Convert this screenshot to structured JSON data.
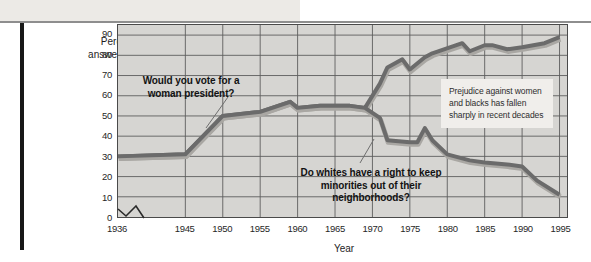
{
  "figure": {
    "y_axis_caption": "Percentage answering yes",
    "x_axis_title": "Year"
  },
  "annotations": {
    "women": "Would you vote for a woman president?",
    "whites": "Do whites have a right to keep minorities out of their neighborhoods?",
    "callout": "Prejudice against women and blacks has fallen sharply in recent decades"
  },
  "chart_data": {
    "type": "line",
    "title": "",
    "subtitle": "",
    "xlabel": "Year",
    "ylabel": "Percentage answering yes",
    "xlim": [
      1936,
      1996
    ],
    "ylim": [
      0,
      95
    ],
    "y_ticks": [
      0,
      10,
      20,
      30,
      40,
      50,
      60,
      70,
      80,
      90
    ],
    "x_ticks": [
      1936,
      1945,
      1950,
      1955,
      1960,
      1965,
      1970,
      1975,
      1980,
      1985,
      1990,
      1995
    ],
    "x_tick_labels": [
      "1936",
      "1945",
      "1950",
      "1955",
      "1960",
      "1965",
      "1970",
      "1975",
      "1980",
      "1985",
      "1990",
      "1995"
    ],
    "y_tick_labels": [
      "0",
      "10",
      "20",
      "30",
      "40",
      "50",
      "60",
      "70",
      "80",
      "90"
    ],
    "grid": true,
    "legend": "none",
    "axis_break": true,
    "plot_background": "#d6d5d2",
    "line_color": "#6b6b6b",
    "series": [
      {
        "name": "Would you vote for a woman president?",
        "color": "#6b6b6b",
        "x": [
          1936,
          1945,
          1950,
          1955,
          1959,
          1960,
          1963,
          1967,
          1969,
          1971,
          1972,
          1974,
          1975,
          1977,
          1978,
          1982,
          1983,
          1985,
          1986,
          1988,
          1990,
          1993,
          1995
        ],
        "values": [
          30,
          31,
          50,
          52,
          57,
          54,
          55,
          55,
          54,
          66,
          74,
          78,
          73,
          79,
          81,
          86,
          82,
          85,
          85,
          83,
          84,
          86,
          89
        ]
      },
      {
        "name": "Do whites have a right to keep minorities out of their neighborhoods?",
        "color": "#6b6b6b",
        "x": [
          1936,
          1945,
          1950,
          1955,
          1959,
          1960,
          1963,
          1967,
          1969,
          1971,
          1972,
          1975,
          1976,
          1977,
          1978,
          1980,
          1983,
          1985,
          1988,
          1990,
          1992,
          1995
        ],
        "values": [
          30,
          31,
          50,
          52,
          57,
          54,
          55,
          55,
          54,
          49,
          38,
          37,
          37,
          44,
          38,
          31,
          28,
          27,
          26,
          25,
          18,
          11
        ]
      }
    ]
  }
}
